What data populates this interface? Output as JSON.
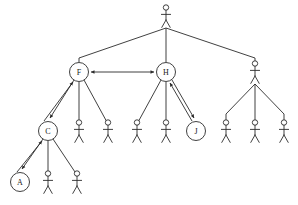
{
  "diagram": {
    "type": "organizational-hierarchy-tree",
    "title": "",
    "canvas": {
      "width": 298,
      "height": 205,
      "background": "#ffffff"
    },
    "style": {
      "line_color": "#2b2b2b",
      "node_fill": "#ffffff",
      "node_stroke": "#2b2b2b",
      "label_color": "#1a1a1a",
      "stroke_width": 0.9,
      "circle_radius": 9.5
    },
    "levels": [
      {
        "index": 0,
        "y": 16,
        "count": 1
      },
      {
        "index": 1,
        "y": 72,
        "count": 3
      },
      {
        "index": 2,
        "y": 131,
        "count": 9
      },
      {
        "index": 3,
        "y": 182,
        "count": 3
      }
    ],
    "nodes": [
      {
        "id": "root",
        "shape": "stick-figure",
        "label": "",
        "x": 166,
        "y": 16,
        "level": 0
      },
      {
        "id": "F",
        "shape": "circle",
        "label": "F",
        "x": 79,
        "y": 72,
        "level": 1
      },
      {
        "id": "H",
        "shape": "circle",
        "label": "H",
        "x": 166,
        "y": 72,
        "level": 1
      },
      {
        "id": "R1",
        "shape": "stick-figure",
        "label": "",
        "x": 255,
        "y": 72,
        "level": 1
      },
      {
        "id": "C",
        "shape": "circle",
        "label": "C",
        "x": 48,
        "y": 131,
        "level": 2
      },
      {
        "id": "F2",
        "shape": "stick-figure",
        "label": "",
        "x": 79,
        "y": 131,
        "level": 2
      },
      {
        "id": "F3",
        "shape": "stick-figure",
        "label": "",
        "x": 108,
        "y": 131,
        "level": 2
      },
      {
        "id": "H1",
        "shape": "stick-figure",
        "label": "",
        "x": 137,
        "y": 131,
        "level": 2
      },
      {
        "id": "H2",
        "shape": "stick-figure",
        "label": "",
        "x": 166,
        "y": 131,
        "level": 2
      },
      {
        "id": "J",
        "shape": "circle",
        "label": "J",
        "x": 196,
        "y": 131,
        "level": 2
      },
      {
        "id": "R1a",
        "shape": "stick-figure",
        "label": "",
        "x": 226,
        "y": 131,
        "level": 2
      },
      {
        "id": "R1b",
        "shape": "stick-figure",
        "label": "",
        "x": 255,
        "y": 131,
        "level": 2
      },
      {
        "id": "R1c",
        "shape": "stick-figure",
        "label": "",
        "x": 284,
        "y": 131,
        "level": 2
      },
      {
        "id": "A",
        "shape": "circle",
        "label": "A",
        "x": 20,
        "y": 182,
        "level": 3
      },
      {
        "id": "C2",
        "shape": "stick-figure",
        "label": "",
        "x": 48,
        "y": 182,
        "level": 3
      },
      {
        "id": "C3",
        "shape": "stick-figure",
        "label": "",
        "x": 77,
        "y": 182,
        "level": 3
      }
    ],
    "edges": [
      {
        "from": "root",
        "to": "F",
        "kind": "orthogonal-branch",
        "arrow": "none"
      },
      {
        "from": "root",
        "to": "H",
        "kind": "vertical",
        "arrow": "none"
      },
      {
        "from": "root",
        "to": "R1",
        "kind": "orthogonal-branch",
        "arrow": "none"
      },
      {
        "from": "F",
        "to": "C",
        "kind": "diagonal",
        "arrow": "both"
      },
      {
        "from": "F",
        "to": "F2",
        "kind": "vertical",
        "arrow": "none"
      },
      {
        "from": "F",
        "to": "F3",
        "kind": "diagonal",
        "arrow": "none"
      },
      {
        "from": "H",
        "to": "H1",
        "kind": "diagonal",
        "arrow": "none"
      },
      {
        "from": "H",
        "to": "H2",
        "kind": "vertical",
        "arrow": "none"
      },
      {
        "from": "H",
        "to": "J",
        "kind": "diagonal",
        "arrow": "both"
      },
      {
        "from": "R1",
        "to": "R1a",
        "kind": "diagonal",
        "arrow": "none"
      },
      {
        "from": "R1",
        "to": "R1b",
        "kind": "vertical",
        "arrow": "none"
      },
      {
        "from": "R1",
        "to": "R1c",
        "kind": "diagonal",
        "arrow": "none"
      },
      {
        "from": "C",
        "to": "A",
        "kind": "diagonal",
        "arrow": "both"
      },
      {
        "from": "C",
        "to": "C2",
        "kind": "vertical",
        "arrow": "none"
      },
      {
        "from": "C",
        "to": "C3",
        "kind": "diagonal",
        "arrow": "none"
      },
      {
        "from": "F",
        "to": "H",
        "kind": "horizontal-link",
        "arrow": "both"
      }
    ],
    "labels": {
      "node_f": "F",
      "node_h": "H",
      "node_c": "C",
      "node_a": "A",
      "node_j": "J"
    }
  }
}
